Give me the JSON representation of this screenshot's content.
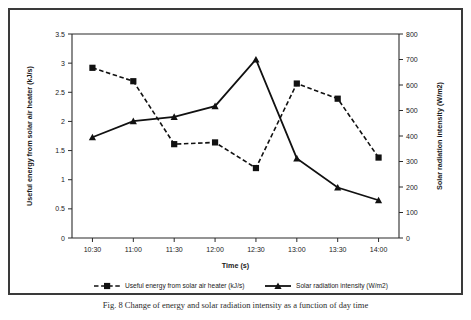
{
  "figure": {
    "caption": "Fig. 8  Change of energy and solar radiation intensity as a function of day time"
  },
  "chart_data": {
    "type": "line",
    "title": "",
    "xlabel": "Time (s)",
    "categories": [
      "10:30",
      "11:00",
      "11:30",
      "12:00",
      "12:30",
      "13:00",
      "13:30",
      "14:00"
    ],
    "grid": false,
    "legend_position": "bottom",
    "axes": {
      "left": {
        "label": "Useful energy from solar air heater (kJ/s)",
        "min": 0,
        "max": 3.5,
        "step": 0.5,
        "ticks": [
          "0",
          "0.5",
          "1",
          "1.5",
          "2",
          "2.5",
          "3",
          "3.5"
        ]
      },
      "right": {
        "label": "Solar radiation intensity  (W/m2)",
        "min": 0,
        "max": 800,
        "step": 100,
        "ticks": [
          "0",
          "100",
          "200",
          "300",
          "400",
          "500",
          "600",
          "700",
          "800"
        ]
      }
    },
    "series": [
      {
        "name": "Useful energy from solar air heater (kJ/s)",
        "axis": "left",
        "style": "dashed",
        "marker": "square",
        "color": "#111111",
        "values": [
          2.92,
          2.69,
          1.61,
          1.64,
          1.2,
          2.65,
          2.39,
          1.38
        ]
      },
      {
        "name": "Solar radiation intensity   (W/m2)",
        "axis": "right",
        "style": "solid",
        "marker": "triangle",
        "color": "#111111",
        "values": [
          395,
          458,
          475,
          517,
          700,
          312,
          198,
          148
        ]
      }
    ]
  }
}
